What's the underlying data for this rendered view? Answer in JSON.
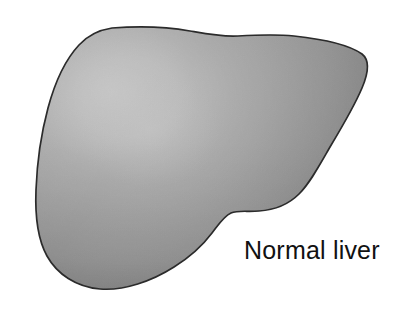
{
  "figure": {
    "background_color": "#ffffff",
    "caption": "Normal liver"
  },
  "organ": {
    "name": "liver",
    "label": "Normal liver",
    "outline_color": "#2b2b2b",
    "outline_width": 1.6,
    "fill_light": "#c3c3c3",
    "fill_mid": "#9a9a9a",
    "fill_dark": "#767676",
    "fill_edge": "#6a6a6a",
    "highlight_color": "#cccccc",
    "highlight_center_x": "112",
    "highlight_center_y": "92"
  },
  "caption_text": {
    "value": "Normal liver",
    "color": "#111111",
    "size_px": "25"
  }
}
